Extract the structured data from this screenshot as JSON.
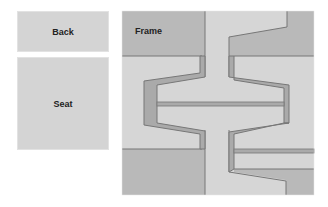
{
  "panels": {
    "back": {
      "label": "Back"
    },
    "seat": {
      "label": "Seat"
    },
    "frame": {
      "label": "Frame"
    }
  },
  "colors": {
    "light_fill": "#d6d6d6",
    "dark_fill": "#b9b9b9",
    "bracket_fill": "#aaaaaa",
    "stroke": "#777777"
  }
}
